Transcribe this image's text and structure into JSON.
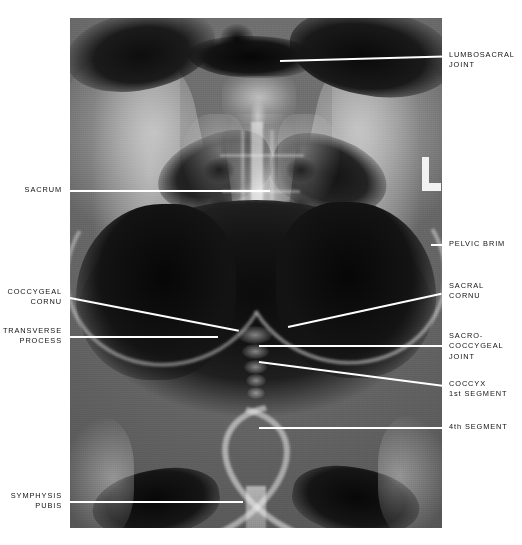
{
  "figure": {
    "kind": "anatomical-radiograph",
    "view": "AP pelvis / sacrum and coccyx radiograph",
    "side_marker": "L",
    "background_color": "#ffffff",
    "leader_color": "#ffffff",
    "label_color": "#111111"
  },
  "labels": {
    "left": [
      {
        "id": "sacrum",
        "text": "SACRUM"
      },
      {
        "id": "coccygeal-cornu",
        "text": "COCCYGEAL\nCORNU"
      },
      {
        "id": "transverse-process",
        "text": "TRANSVERSE\nPROCESS"
      },
      {
        "id": "symphysis-pubis",
        "text": "SYMPHYSIS\nPUBIS"
      }
    ],
    "right": [
      {
        "id": "lumbosacral-joint",
        "text": "LUMBOSACRAL\nJOINT"
      },
      {
        "id": "pelvic-brim",
        "text": "PELVIC BRIM"
      },
      {
        "id": "sacral-cornu",
        "text": "SACRAL\nCORNU"
      },
      {
        "id": "sacro-coccygeal-joint",
        "text": "SACRO-\nCOCCYGEAL\nJOINT"
      },
      {
        "id": "coccyx-1st-segment",
        "text": "COCCYX\n1st SEGMENT"
      },
      {
        "id": "fourth-segment",
        "text": "4th SEGMENT"
      }
    ]
  }
}
